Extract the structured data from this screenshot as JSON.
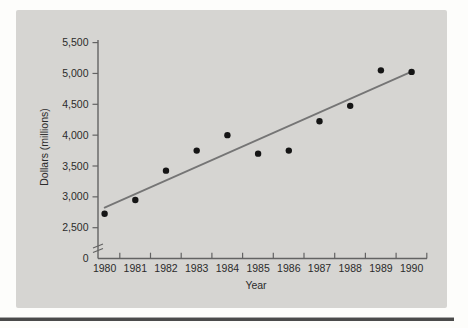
{
  "figure": {
    "panel_background": "#d6d5d2",
    "page_background": "#fdfdfb",
    "bottom_rule_color": "#4a4a4a"
  },
  "chart_data": {
    "type": "scatter",
    "title": "",
    "xlabel": "Year",
    "ylabel": "Dollars (millions)",
    "x": [
      1980,
      1981,
      1982,
      1983,
      1984,
      1985,
      1986,
      1987,
      1988,
      1989,
      1990
    ],
    "x_tick_labels": [
      "1980",
      "1981",
      "1982",
      "1983",
      "1984",
      "1985",
      "1986",
      "1987",
      "1988",
      "1989",
      "1990"
    ],
    "values": [
      2725,
      2950,
      3425,
      3750,
      4000,
      3700,
      3750,
      4225,
      4475,
      5050,
      5025
    ],
    "y_ticks": [
      {
        "label": "5,500",
        "value": 5500
      },
      {
        "label": "5,000",
        "value": 5000
      },
      {
        "label": "4,500",
        "value": 4500
      },
      {
        "label": "4,000",
        "value": 4000
      },
      {
        "label": "3,500",
        "value": 3500
      },
      {
        "label": "3,000",
        "value": 3000
      },
      {
        "label": "2,500",
        "value": 2500
      }
    ],
    "y_zero_label": "0",
    "axis_break": true,
    "ylim": [
      2500,
      5500
    ],
    "grid": false,
    "legend": false,
    "trend_line": {
      "x1": 1980,
      "y1": 2825,
      "x2": 1990,
      "y2": 5030
    },
    "colors": {
      "point": "#151515",
      "trend_line": "#757575",
      "axis": "#636363",
      "tick_text": "#2b2b2b"
    }
  }
}
